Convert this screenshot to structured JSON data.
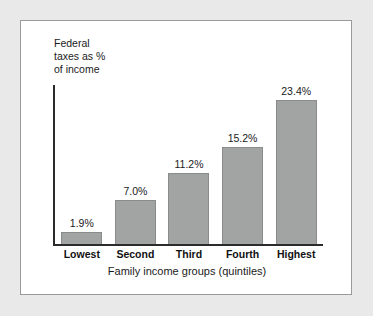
{
  "chart_data": {
    "type": "bar",
    "title": "",
    "ylabel": "Federal\ntaxes as %\nof income",
    "xlabel": "Family income groups (quintiles)",
    "categories": [
      "Lowest",
      "Second",
      "Third",
      "Fourth",
      "Highest"
    ],
    "values": [
      1.9,
      7.0,
      11.2,
      15.2,
      23.4
    ],
    "value_labels": [
      "1.9%",
      "7.0%",
      "11.2%",
      "15.2%",
      "23.4%"
    ],
    "ylim": [
      0,
      25
    ],
    "grid": false,
    "legend": "none",
    "bar_color": "#a2a4a4",
    "bar_border_color": "#8a8c8c",
    "axis_color": "#2b2b2b",
    "panel_background": "#ffffff",
    "page_background": "#e9e9e9"
  }
}
